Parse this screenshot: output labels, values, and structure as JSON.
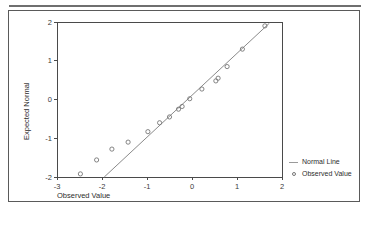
{
  "chart_data": {
    "type": "scatter",
    "title": "",
    "xlabel": "Observed Value",
    "ylabel": "Expected Normal",
    "xlim": [
      -3,
      2
    ],
    "ylim": [
      -2,
      2
    ],
    "xticks": [
      "-3",
      "-2",
      "-1",
      "0",
      "1",
      "2"
    ],
    "xtick_values": [
      -3,
      -2,
      -1,
      0,
      1,
      2
    ],
    "yticks": [
      "2",
      "1",
      "0",
      "-1",
      "-2"
    ],
    "ytick_values": [
      2,
      1,
      0,
      -1,
      -2
    ],
    "grid": false,
    "legend_position": "right",
    "series": [
      {
        "name": "Normal Line",
        "type": "line",
        "color": "#8a8a8a",
        "x": [
          -1.95,
          1.72
        ],
        "y": [
          -2.0,
          1.97
        ]
      },
      {
        "name": "Observed Value",
        "type": "scatter",
        "marker": "circle-open",
        "color": "#767676",
        "points": [
          [
            -2.48,
            -1.92
          ],
          [
            -2.12,
            -1.56
          ],
          [
            -1.78,
            -1.28
          ],
          [
            -1.42,
            -1.1
          ],
          [
            -0.98,
            -0.83
          ],
          [
            -0.72,
            -0.6
          ],
          [
            -0.5,
            -0.45
          ],
          [
            -0.3,
            -0.25
          ],
          [
            -0.22,
            -0.18
          ],
          [
            -0.05,
            0.02
          ],
          [
            0.22,
            0.27
          ],
          [
            0.53,
            0.48
          ],
          [
            0.58,
            0.55
          ],
          [
            0.78,
            0.85
          ],
          [
            1.12,
            1.3
          ],
          [
            1.62,
            1.9
          ]
        ]
      }
    ]
  },
  "legend": {
    "items": [
      {
        "label": "Normal Line",
        "swatch": "line-swatch"
      },
      {
        "label": "Observed Value",
        "swatch": "circle-marker"
      }
    ]
  }
}
